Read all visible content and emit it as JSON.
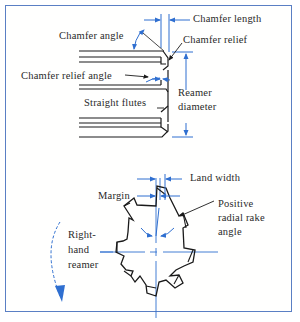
{
  "diagram": {
    "colors": {
      "frame": "#5a7fc4",
      "dimension": "#2f6fd0",
      "outline": "#1a1a1a",
      "text": "#2a2a2a"
    },
    "side_view": {
      "labels": {
        "chamfer_length": "Chamfer length",
        "chamfer_angle": "Chamfer angle",
        "chamfer_relief": "Chamfer  relief",
        "chamfer_relief_angle": "Chamfer relief angle",
        "reamer_diameter_1": "Reamer",
        "reamer_diameter_2": "diameter",
        "straight_flutes": "Straight flutes"
      }
    },
    "end_view": {
      "labels": {
        "land_width": "Land width",
        "margin": "Margin",
        "positive_radial_rake_1": "Positive",
        "positive_radial_rake_2": "radial rake",
        "positive_radial_rake_3": "angle",
        "right_hand_1": "Right-",
        "right_hand_2": "hand",
        "right_hand_3": "reamer"
      },
      "teeth_count": 8
    }
  }
}
